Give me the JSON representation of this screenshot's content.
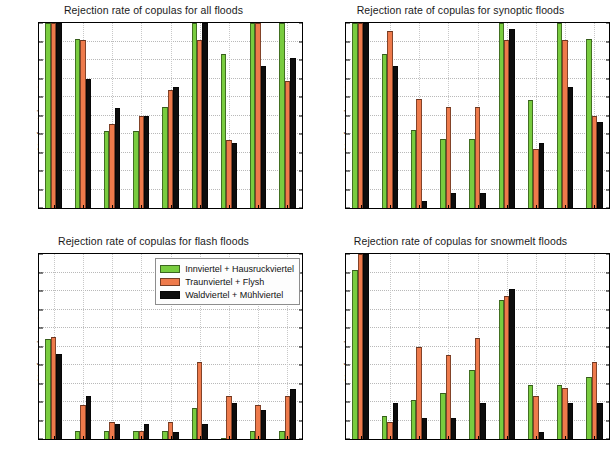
{
  "colors": {
    "series1": "#79cc3f",
    "series2": "#ee7a4b",
    "series3": "#0d0d0d",
    "grid": "#b9b9b9",
    "axis": "#000000",
    "background": "#ffffff"
  },
  "legend": {
    "items": [
      {
        "label": "Innviertel + Hausruckviertel",
        "color": "#79cc3f"
      },
      {
        "label": "Traunviertel + Flysh",
        "color": "#ee7a4b"
      },
      {
        "label": "Waldviertel + Mühlviertel",
        "color": "#0d0d0d"
      }
    ]
  },
  "axis": {
    "ylabel": "% of catchments",
    "yticks": [
      "0",
      "10",
      "20",
      "30",
      "40",
      "50",
      "60",
      "70",
      "80",
      "90",
      "100"
    ],
    "ylim": [
      0,
      100
    ],
    "categories": [
      "cla",
      "fra",
      "gal",
      "gum",
      "hus",
      "joe",
      "nor",
      "pla",
      "tco"
    ]
  },
  "chart_data": [
    {
      "type": "bar",
      "panel": "top-left",
      "title": "Rejection rate of copulas for all floods",
      "xlabel": "",
      "ylabel": "% of catchments",
      "ylim": [
        0,
        100
      ],
      "grid": true,
      "legend_position": "none",
      "categories": [
        "cla",
        "fra",
        "gal",
        "gum",
        "hus",
        "joe",
        "nor",
        "pla",
        "tco"
      ],
      "series": [
        {
          "name": "Innviertel + Hausruckviertel",
          "color": "#79cc3f",
          "values": [
            100,
            91.5,
            41.5,
            41.5,
            54.5,
            100,
            83.5,
            100,
            100
          ]
        },
        {
          "name": "Traunviertel + Flysh",
          "color": "#ee7a4b",
          "values": [
            100,
            91,
            45.5,
            50,
            64,
            91,
            36.5,
            100,
            68.5
          ]
        },
        {
          "name": "Waldviertel + Mühlviertel",
          "color": "#0d0d0d",
          "values": [
            100,
            69.5,
            54,
            50,
            65.5,
            100,
            35,
            77,
            81
          ]
        }
      ]
    },
    {
      "type": "bar",
      "panel": "top-right",
      "title": "Rejection rate of copulas for synoptic floods",
      "xlabel": "",
      "ylabel": "% of catchments",
      "ylim": [
        0,
        100
      ],
      "grid": true,
      "legend_position": "none",
      "categories": [
        "cla",
        "fra",
        "gal",
        "gum",
        "hus",
        "joe",
        "nor",
        "pla",
        "tco"
      ],
      "series": [
        {
          "name": "Innviertel + Hausruckviertel",
          "color": "#79cc3f",
          "values": [
            100,
            83.5,
            42,
            37.5,
            37.5,
            100,
            58.5,
            100,
            91.5
          ]
        },
        {
          "name": "Traunviertel + Flysh",
          "color": "#ee7a4b",
          "values": [
            100,
            95.5,
            59,
            54.5,
            54.5,
            91,
            32,
            91,
            50
          ]
        },
        {
          "name": "Waldviertel + Mühlviertel",
          "color": "#0d0d0d",
          "values": [
            100,
            77,
            4,
            8,
            8,
            96.5,
            35,
            65.5,
            46.5
          ]
        }
      ]
    },
    {
      "type": "bar",
      "panel": "bottom-left",
      "title": "Rejection rate of copulas for flash floods",
      "xlabel": "",
      "ylabel": "% of catchments",
      "ylim": [
        0,
        100
      ],
      "grid": true,
      "legend_position": "top-right",
      "categories": [
        "cla",
        "fra",
        "gal",
        "gum",
        "hus",
        "joe",
        "nor",
        "pla",
        "tco"
      ],
      "series": [
        {
          "name": "Innviertel + Hausruckviertel",
          "color": "#79cc3f",
          "values": [
            54,
            4.5,
            4.5,
            4.5,
            4.5,
            17,
            0,
            4.5,
            4.5
          ]
        },
        {
          "name": "Traunviertel + Flysh",
          "color": "#ee7a4b",
          "values": [
            55,
            18.5,
            9,
            4.5,
            9,
            41.5,
            23,
            18.5,
            23
          ]
        },
        {
          "name": "Waldviertel + Mühlviertel",
          "color": "#0d0d0d",
          "values": [
            46,
            23.5,
            8,
            8,
            4,
            8,
            19.5,
            15.5,
            27
          ]
        }
      ]
    },
    {
      "type": "bar",
      "panel": "bottom-right",
      "title": "Rejection rate of copulas for snowmelt floods",
      "xlabel": "",
      "ylabel": "% of catchments",
      "ylim": [
        0,
        100
      ],
      "grid": true,
      "legend_position": "none",
      "categories": [
        "cla",
        "fra",
        "gal",
        "gum",
        "hus",
        "joe",
        "nor",
        "pla",
        "tco"
      ],
      "series": [
        {
          "name": "Innviertel + Hausruckviertel",
          "color": "#79cc3f",
          "values": [
            91.5,
            12.5,
            21,
            25,
            37.5,
            75,
            29,
            29,
            33.5
          ]
        },
        {
          "name": "Traunviertel + Flysh",
          "color": "#ee7a4b",
          "values": [
            100,
            9,
            50,
            45.5,
            54.5,
            77.5,
            23,
            27.5,
            41.5
          ]
        },
        {
          "name": "Waldviertel + Mühlviertel",
          "color": "#0d0d0d",
          "values": [
            100,
            19.5,
            11.5,
            11.5,
            19.5,
            81,
            4,
            19.5,
            19.5
          ]
        }
      ]
    }
  ]
}
